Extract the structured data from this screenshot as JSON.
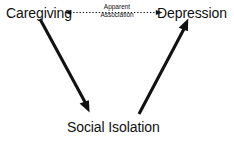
{
  "figure": {
    "background_color": "#ffffff",
    "ink_color": "#111111",
    "width": 234,
    "height": 142
  },
  "nodes": [
    {
      "id": "caregiving",
      "label": "Caregiving"
    },
    {
      "id": "depression",
      "label": "Depression"
    },
    {
      "id": "social_isolation",
      "label": "Social Isolation"
    }
  ],
  "node_labels": {
    "caregiving": "Caregiving",
    "depression": "Depression",
    "social_isolation": "Social Isolation"
  },
  "edges": [
    {
      "id": "apparent-association",
      "from": "caregiving",
      "to": "depression",
      "style": "dotted",
      "direction": "bidirectional",
      "label_line1": "Apparent",
      "label_line2": "Association"
    },
    {
      "id": "caregiving-to-social-isolation",
      "from": "caregiving",
      "to": "social_isolation",
      "style": "solid",
      "direction": "forward",
      "label_line1": "",
      "label_line2": ""
    },
    {
      "id": "social-isolation-to-depression",
      "from": "social_isolation",
      "to": "depression",
      "style": "solid",
      "direction": "forward",
      "label_line1": "",
      "label_line2": ""
    }
  ],
  "edge_labels": {
    "apparent_association_line1": "Apparent",
    "apparent_association_line2": "Association"
  }
}
